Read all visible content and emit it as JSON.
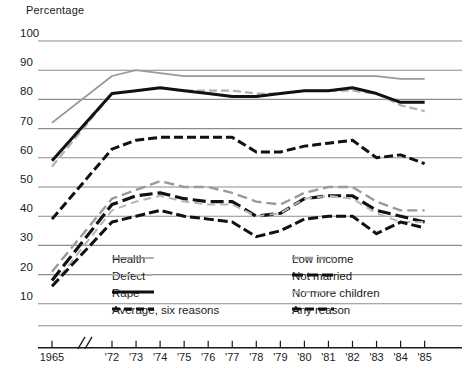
{
  "axis_title": "Percentage",
  "y_ticks": [
    100,
    90,
    80,
    70,
    60,
    50,
    40,
    30,
    20,
    10
  ],
  "x_ticks": [
    "1965",
    "'72",
    "'73",
    "'74",
    "'75",
    "'76",
    "'77",
    "'78",
    "'79",
    "'80",
    "'81",
    "'82",
    "'83",
    "'84",
    "'85"
  ],
  "axis_break_symbol": "//",
  "legend": {
    "items": [
      {
        "label": "Health",
        "color": "#9a9a9a",
        "width": 1.7,
        "dash": "none",
        "col": 0,
        "row": 0
      },
      {
        "label": "Defect",
        "color": "#b0b0b0",
        "width": 2.2,
        "dash": "7,4",
        "col": 0,
        "row": 1
      },
      {
        "label": "Rape",
        "color": "#111111",
        "width": 3.0,
        "dash": "none",
        "col": 0,
        "row": 2
      },
      {
        "label": "Average, six reasons",
        "color": "#111111",
        "width": 3.0,
        "dash": "8,4",
        "col": 0,
        "row": 3
      },
      {
        "label": "Low income",
        "color": "#9a9a9a",
        "width": 2.4,
        "dash": "8,5",
        "col": 1,
        "row": 0
      },
      {
        "label": "Not married",
        "color": "#111111",
        "width": 3.2,
        "dash": "11,4",
        "col": 1,
        "row": 1
      },
      {
        "label": "No more children",
        "color": "#b5b5b5",
        "width": 2.0,
        "dash": "7,5",
        "col": 1,
        "row": 2
      },
      {
        "label": "Any reason",
        "color": "#111111",
        "width": 3.0,
        "dash": "9,4",
        "col": 1,
        "row": 3
      }
    ]
  },
  "chart_data": {
    "type": "line",
    "title": "",
    "xlabel": "",
    "ylabel": "Percentage",
    "ylim": [
      10,
      100
    ],
    "grid": true,
    "legend_position": "inside-bottom",
    "axis_break_after": "1965",
    "x": [
      "1965",
      "1972",
      "1973",
      "1974",
      "1975",
      "1976",
      "1977",
      "1978",
      "1979",
      "1980",
      "1981",
      "1982",
      "1983",
      "1984",
      "1985"
    ],
    "series": [
      {
        "name": "Health",
        "style": "gray-solid",
        "values": [
          72,
          88,
          90,
          89,
          88,
          88,
          88,
          88,
          88,
          88,
          88,
          88,
          88,
          87,
          87
        ]
      },
      {
        "name": "Defect",
        "style": "gray-dashed",
        "values": [
          57,
          82,
          83,
          84,
          83,
          83,
          83,
          82,
          82,
          83,
          83,
          83,
          82,
          78,
          76
        ]
      },
      {
        "name": "Rape",
        "style": "black-solid",
        "values": [
          59,
          82,
          83,
          84,
          83,
          82,
          81,
          81,
          82,
          83,
          83,
          84,
          82,
          79,
          79
        ]
      },
      {
        "name": "Average, six reasons",
        "style": "black-dashed",
        "values": [
          39,
          63,
          66,
          67,
          67,
          67,
          67,
          62,
          62,
          64,
          65,
          66,
          60,
          61,
          58
        ]
      },
      {
        "name": "Low income",
        "style": "gray-long-dashed",
        "values": [
          21,
          46,
          49,
          52,
          50,
          50,
          48,
          45,
          44,
          48,
          50,
          50,
          45,
          42,
          42
        ]
      },
      {
        "name": "Not married",
        "style": "black-long-dashed",
        "values": [
          18,
          44,
          47,
          48,
          46,
          45,
          45,
          40,
          41,
          46,
          47,
          47,
          42,
          40,
          38
        ]
      },
      {
        "name": "No more children",
        "style": "gray-dashed-2",
        "values": [
          16,
          42,
          45,
          47,
          45,
          44,
          44,
          40,
          41,
          46,
          47,
          46,
          41,
          38,
          38
        ]
      },
      {
        "name": "Any reason",
        "style": "black-dashed-2",
        "values": [
          16,
          38,
          40,
          42,
          40,
          39,
          38,
          33,
          35,
          39,
          40,
          40,
          34,
          38,
          36
        ]
      }
    ]
  },
  "style_map": {
    "gray-solid": {
      "color": "#9a9a9a",
      "width": 1.7,
      "dash": "none"
    },
    "gray-dashed": {
      "color": "#b0b0b0",
      "width": 2.2,
      "dash": "8,4"
    },
    "black-solid": {
      "color": "#111111",
      "width": 3.0,
      "dash": "none"
    },
    "black-dashed": {
      "color": "#111111",
      "width": 3.0,
      "dash": "9,4"
    },
    "gray-long-dashed": {
      "color": "#9a9a9a",
      "width": 2.4,
      "dash": "10,5"
    },
    "black-long-dashed": {
      "color": "#111111",
      "width": 3.2,
      "dash": "13,5"
    },
    "gray-dashed-2": {
      "color": "#b5b5b5",
      "width": 2.0,
      "dash": "8,5"
    },
    "black-dashed-2": {
      "color": "#111111",
      "width": 3.0,
      "dash": "10,4"
    }
  },
  "geometry": {
    "plot_left": 38,
    "plot_right": 462,
    "y_top_px": 41,
    "y_step_px": 29.2,
    "x_1965_px": 52,
    "x_72_px": 112,
    "x_step_px": 24.05,
    "grid_color": "#8c8c8c",
    "axis_color": "#1a1a1a"
  }
}
